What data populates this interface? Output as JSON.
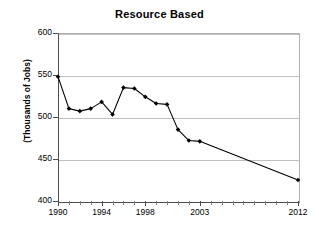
{
  "chart_data": {
    "type": "line",
    "title": "Resource Based",
    "xlabel": "",
    "ylabel": "(Thousands of Jobs)",
    "x": [
      1990,
      1991,
      1992,
      1993,
      1994,
      1995,
      1996,
      1997,
      1998,
      1999,
      2000,
      2001,
      2002,
      2003,
      2012
    ],
    "values": [
      548,
      510,
      507,
      510,
      518,
      503,
      535,
      534,
      524,
      516,
      515,
      485,
      472,
      471,
      425
    ],
    "series": [
      {
        "name": "Resource Based",
        "values": [
          548,
          510,
          507,
          510,
          518,
          503,
          535,
          534,
          524,
          516,
          515,
          485,
          472,
          471,
          425
        ]
      }
    ],
    "xlim": [
      1990,
      2012
    ],
    "ylim": [
      400,
      600
    ],
    "ytick_labels": [
      "600",
      "550",
      "500",
      "450",
      "400"
    ],
    "ytick_values": [
      600,
      550,
      500,
      450,
      400
    ],
    "xtick_labels": [
      "1990",
      "1994",
      "1998",
      "2003",
      "2012"
    ],
    "xtick_values": [
      1990,
      1994,
      1998,
      2003,
      2012
    ],
    "xtick_minor_values": [
      1991,
      1992,
      1993,
      1995,
      1996,
      1997,
      1999,
      2000,
      2001,
      2002,
      2004,
      2005,
      2006,
      2007,
      2008,
      2009,
      2010,
      2011
    ],
    "grid": "horizontal",
    "legend": "none",
    "marker": "filled-diamond",
    "line_color": "#000000",
    "marker_color": "#000000",
    "grid_color": "#BFBFBF",
    "axis_color": "#4D4D4D",
    "background_color": "#FFFFFF"
  }
}
